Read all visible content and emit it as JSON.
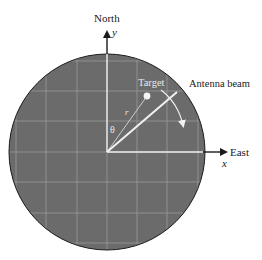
{
  "diagram": {
    "labels": {
      "north": "North",
      "y_axis": "y",
      "east": "East",
      "x_axis": "x",
      "target": "Target",
      "antenna_beam": "Antenna beam",
      "range": "r",
      "angle": "θ"
    },
    "colors": {
      "disc_fill": "#6b6b6b",
      "grid_line": "#9a9a9a",
      "axis_white": "#f2f2f2",
      "outline": "#1a1a1a",
      "background": "#ffffff"
    },
    "geometry": {
      "center": [
        107,
        152
      ],
      "radius": 98,
      "grid_spacing": 30.5
    }
  }
}
